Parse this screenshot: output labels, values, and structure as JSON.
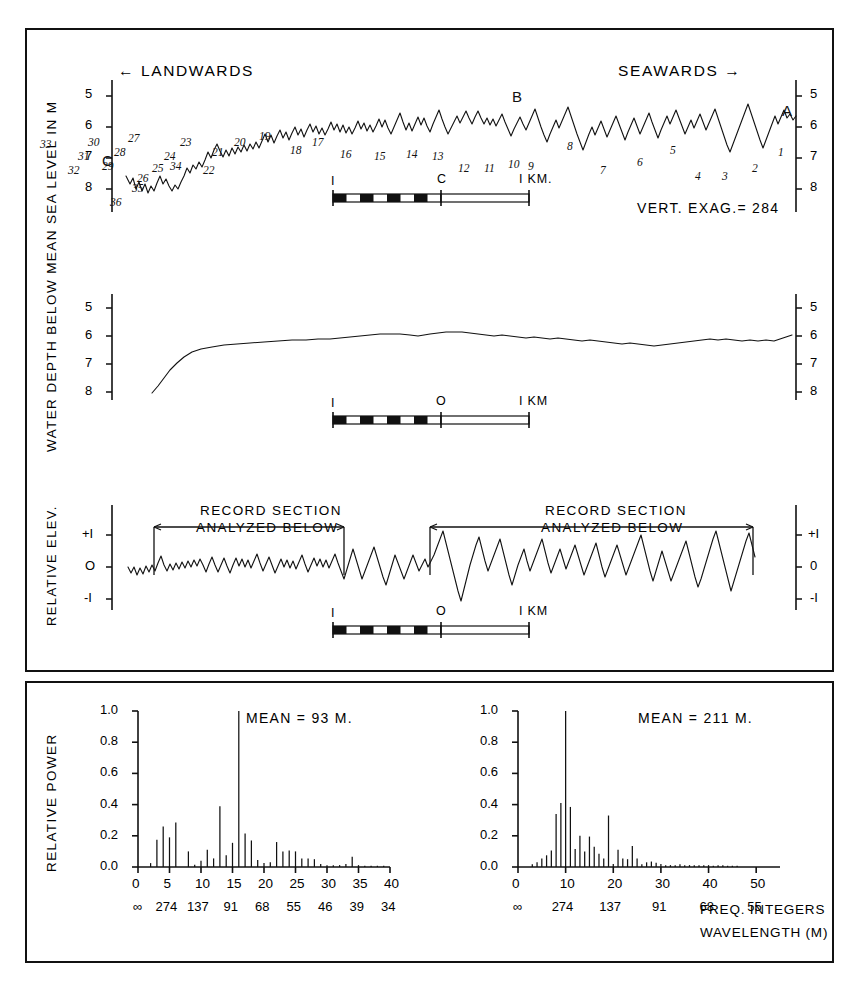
{
  "figure": {
    "panels": {
      "top": {
        "direction_left": "← LANDWARDS",
        "direction_right": "SEAWARDS →",
        "y_axis_label": "WATER DEPTH BELOW MEAN SEA LEVEL IN M",
        "y_ticks": [
          "5",
          "6",
          "7",
          "8"
        ],
        "endpoint_left": "C",
        "endpoint_right": "A",
        "midpoint_label": "B",
        "vert_exag": "VERT. EXAG.= 284",
        "scale_left": "I",
        "scale_center": "C",
        "scale_right": "I KM.",
        "peak_numbers": [
          "1",
          "2",
          "3",
          "4",
          "5",
          "6",
          "7",
          "8",
          "9",
          "10",
          "11",
          "12",
          "13",
          "14",
          "15",
          "16",
          "17",
          "18",
          "19",
          "20",
          "21",
          "22",
          "23",
          "24",
          "25",
          "26",
          "27",
          "28",
          "29",
          "30",
          "31",
          "32",
          "33",
          "34",
          "35",
          "36"
        ]
      },
      "middle": {
        "y_ticks": [
          "5",
          "6",
          "7",
          "8"
        ],
        "scale_left": "I",
        "scale_center": "O",
        "scale_right": "I KM"
      },
      "bottom_profile": {
        "y_axis_label": "RELATIVE ELEV.",
        "y_ticks_left": [
          "+I",
          "O",
          "-I"
        ],
        "y_ticks_right": [
          "+I",
          "0",
          "-I"
        ],
        "annotation_left_line1": "RECORD SECTION",
        "annotation_left_line2": "ANALYZED BELOW",
        "annotation_right_line1": "RECORD SECTION",
        "annotation_right_line2": "ANALYZED BELOW",
        "scale_left": "I",
        "scale_center": "O",
        "scale_right": "I KM"
      }
    },
    "spectra_y_axis_label": "RELATIVE POWER",
    "freq_axis_caption": "FREQ. INTEGERS",
    "wavelength_axis_caption": "WAVELENGTH (M)"
  },
  "chart_data": [
    {
      "type": "bar",
      "title": "",
      "annotation": "MEAN = 93 M.",
      "xlabel": "FREQ. INTEGERS",
      "ylabel": "RELATIVE POWER",
      "ylim": [
        0.0,
        1.0
      ],
      "xlim": [
        0,
        40
      ],
      "y_ticks": [
        "0.0",
        "0.2",
        "0.4",
        "0.6",
        "0.8",
        "1.0"
      ],
      "y_tick_values": [
        0.0,
        0.2,
        0.4,
        0.6,
        0.8,
        1.0
      ],
      "x_ticks": [
        "0",
        "5",
        "10",
        "15",
        "20",
        "25",
        "30",
        "35",
        "40"
      ],
      "x_tick_values": [
        0,
        5,
        10,
        15,
        20,
        25,
        30,
        35,
        40
      ],
      "secondary_x_ticks": [
        "∞",
        "274",
        "137",
        "91",
        "68",
        "55",
        "46",
        "39",
        "34"
      ],
      "grid": false,
      "x": [
        2,
        3,
        4,
        5,
        6,
        8,
        9,
        10,
        11,
        12,
        13,
        14,
        15,
        16,
        17,
        18,
        19,
        20,
        21,
        22,
        23,
        24,
        25,
        26,
        27,
        28,
        29,
        30,
        31,
        32,
        33,
        34,
        35,
        36,
        37,
        38,
        39
      ],
      "values": [
        0.025,
        0.175,
        0.26,
        0.19,
        0.285,
        0.1,
        0.015,
        0.04,
        0.11,
        0.055,
        0.39,
        0.075,
        0.155,
        1.0,
        0.215,
        0.17,
        0.045,
        0.025,
        0.03,
        0.16,
        0.1,
        0.105,
        0.1,
        0.055,
        0.055,
        0.05,
        0.02,
        0.012,
        0.012,
        0.012,
        0.02,
        0.065,
        0.012,
        0.008,
        0.008,
        0.008,
        0.008
      ]
    },
    {
      "type": "bar",
      "title": "",
      "annotation": "MEAN = 211 M.",
      "xlabel": "FREQ. INTEGERS",
      "ylabel": "RELATIVE POWER",
      "ylim": [
        0.0,
        1.0
      ],
      "xlim": [
        0,
        55
      ],
      "y_ticks": [
        "0.0",
        "0.2",
        "0.4",
        "0.6",
        "0.8",
        "1.0"
      ],
      "y_tick_values": [
        0.0,
        0.2,
        0.4,
        0.6,
        0.8,
        1.0
      ],
      "x_ticks": [
        "0",
        "10",
        "20",
        "30",
        "40",
        "50"
      ],
      "x_tick_values": [
        0,
        10,
        20,
        30,
        40,
        50
      ],
      "secondary_x_ticks": [
        "∞",
        "274",
        "137",
        "91",
        "68",
        "55"
      ],
      "grid": false,
      "x": [
        3,
        4,
        5,
        6,
        7,
        8,
        9,
        10,
        11,
        12,
        13,
        14,
        15,
        16,
        17,
        18,
        19,
        20,
        21,
        22,
        23,
        24,
        25,
        26,
        27,
        28,
        29,
        30,
        31,
        32,
        33,
        34,
        35,
        36,
        37,
        38,
        39,
        40,
        41,
        42,
        43,
        44,
        45,
        46
      ],
      "values": [
        0.018,
        0.03,
        0.055,
        0.075,
        0.105,
        0.34,
        0.41,
        1.0,
        0.385,
        0.115,
        0.2,
        0.1,
        0.195,
        0.13,
        0.085,
        0.055,
        0.33,
        0.02,
        0.11,
        0.055,
        0.05,
        0.135,
        0.055,
        0.018,
        0.03,
        0.035,
        0.028,
        0.02,
        0.012,
        0.012,
        0.012,
        0.018,
        0.012,
        0.012,
        0.012,
        0.012,
        0.012,
        0.012,
        0.008,
        0.012,
        0.012,
        0.008,
        0.008,
        0.008
      ]
    }
  ]
}
